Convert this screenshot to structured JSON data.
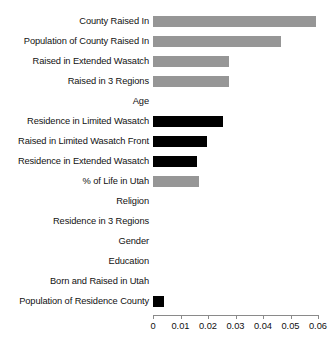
{
  "chart_data": {
    "type": "bar",
    "orientation": "horizontal",
    "title": "",
    "subtitle": "",
    "xlabel": "",
    "ylabel": "",
    "xlim": [
      0,
      0.06
    ],
    "ylim": null,
    "grid": false,
    "legend": null,
    "xticks": [
      0,
      0.01,
      0.02,
      0.03,
      0.04,
      0.05,
      0.06
    ],
    "xticklabels": [
      "0",
      "0.01",
      "0.02",
      "0.03",
      "0.04",
      "0.05",
      "0.06"
    ],
    "categories": [
      "County Raised In",
      "Population of County Raised In",
      "Raised in Extended Wasatch",
      "Raised in 3 Regions",
      "Age",
      "Residence in Limited Wasatch",
      "Raised in Limited Wasatch Front",
      "Residence in Extended Wasatch",
      "% of Life in Utah",
      "Religion",
      "Residence in 3 Regions",
      "Gender",
      "Education",
      "Born and Raised in Utah",
      "Population of Residence County"
    ],
    "values": [
      0.0593,
      0.0465,
      0.0278,
      0.0276,
      0.0,
      0.0256,
      0.0196,
      0.016,
      0.0166,
      0.0,
      0.0,
      0.0,
      0.0,
      0.0,
      0.004
    ],
    "colors": [
      "#969696",
      "#969696",
      "#969696",
      "#969696",
      "#969696",
      "#000000",
      "#000000",
      "#000000",
      "#969696",
      "#969696",
      "#969696",
      "#969696",
      "#969696",
      "#969696",
      "#000000"
    ],
    "palette": {
      "gray": "#969696",
      "black": "#000000",
      "axis": "#8a8a8a",
      "background": "#ffffff"
    }
  }
}
